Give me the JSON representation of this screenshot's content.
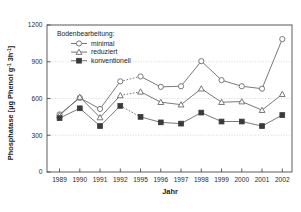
{
  "chart_data": {
    "type": "line",
    "title": "",
    "xlabel": "Jahr",
    "ylabel": "Phosphatase [µg Phenol  g-1  3h-1]",
    "ylabel_parts": {
      "main": "Phosphatase [µg Phenol",
      "g": "g",
      "g_sup": "-1",
      "h": "3h",
      "h_sup": "-1",
      "close": "]"
    },
    "legend_title": "Bodenbearbeitung:",
    "legend_position": "top-left-inside",
    "grid": true,
    "categories": [
      "1989",
      "1990",
      "1991",
      "1992",
      "1995",
      "1996",
      "1997",
      "1998",
      "1999",
      "2000",
      "2001",
      "2002"
    ],
    "xlim": [
      0,
      11
    ],
    "ylim": [
      0,
      1200
    ],
    "yticks": [
      0,
      300,
      600,
      900,
      1200
    ],
    "gap_after_index": 3,
    "series": [
      {
        "name": "minimal",
        "marker": "open-circle",
        "values": [
          470,
          605,
          515,
          740,
          780,
          695,
          700,
          905,
          750,
          700,
          680,
          1085
        ]
      },
      {
        "name": "reduziert",
        "marker": "open-triangle",
        "values": [
          462,
          612,
          445,
          625,
          655,
          570,
          550,
          680,
          570,
          575,
          505,
          635
        ]
      },
      {
        "name": "konventionell",
        "marker": "filled-square",
        "values": [
          440,
          520,
          375,
          540,
          450,
          405,
          395,
          485,
          412,
          412,
          375,
          465
        ]
      }
    ]
  },
  "colors": {
    "frame": "#4d4d4d",
    "grid": "#c8c8c8",
    "line": "#6a6a6a",
    "marker_fill_open": "#ffffff",
    "marker_fill_solid": "#3a3a3a",
    "text": "#1a1a1a",
    "background": "#ffffff"
  }
}
